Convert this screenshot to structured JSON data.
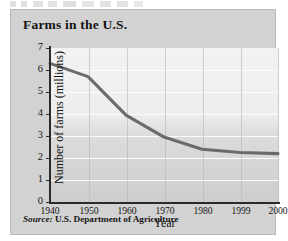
{
  "figure": {
    "title": "Farms in the U.S.",
    "source_keyword": "Source:",
    "source_text": "U.S. Department of Agriculture"
  },
  "chart_data": {
    "type": "line",
    "title": "Farms in the U.S.",
    "xlabel": "Year",
    "ylabel": "Number of farms (millions)",
    "x_tick_labels": [
      "1940",
      "1950",
      "1960",
      "1970",
      "1980",
      "1999",
      "2000"
    ],
    "y_tick_labels": [
      "0",
      "1",
      "2",
      "3",
      "4",
      "5",
      "6",
      "7"
    ],
    "xlim": [
      1940,
      2000
    ],
    "ylim": [
      0,
      7
    ],
    "y_ticks": [
      0,
      1,
      2,
      3,
      4,
      5,
      6,
      7
    ],
    "grid": "horizontal-white-and-vertical-gray",
    "legend": "none",
    "categories": [
      "1940",
      "1950",
      "1960",
      "1970",
      "1980",
      "1999",
      "2000"
    ],
    "values": [
      6.3,
      5.7,
      3.95,
      2.95,
      2.4,
      2.25,
      2.2
    ],
    "series": [
      {
        "name": "Number of farms (millions)",
        "color": "#6b6b6b",
        "values": [
          6.3,
          5.7,
          3.95,
          2.95,
          2.4,
          2.25,
          2.2
        ]
      }
    ]
  },
  "colors": {
    "line": "#6b6b6b",
    "card_background": "#d2d2d2",
    "plot_background": "#cfcfcf",
    "gridline": "#fbfbfb",
    "axis": "#2a2a2a"
  }
}
